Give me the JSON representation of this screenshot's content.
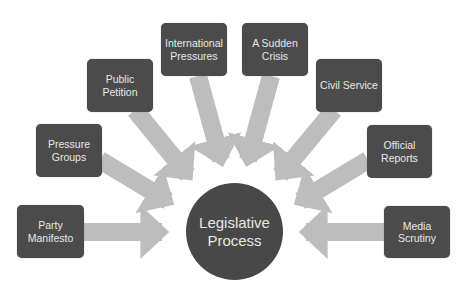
{
  "diagram": {
    "center": {
      "label_line1": "Legislative",
      "label_line2": "Process"
    },
    "sources": [
      {
        "id": "party-manifesto",
        "line1": "Party",
        "line2": "Manifesto"
      },
      {
        "id": "pressure-groups",
        "line1": "Pressure",
        "line2": "Groups"
      },
      {
        "id": "public-petition",
        "line1": "Public",
        "line2": "Petition"
      },
      {
        "id": "international-pressures",
        "line1": "International",
        "line2": "Pressures"
      },
      {
        "id": "a-sudden-crisis",
        "line1": "A Sudden",
        "line2": "Crisis"
      },
      {
        "id": "civil-service",
        "line1": "Civil Service",
        "line2": ""
      },
      {
        "id": "official-reports",
        "line1": "Official",
        "line2": "Reports"
      },
      {
        "id": "media-scrutiny",
        "line1": "Media",
        "line2": "Scrutiny"
      }
    ],
    "colors": {
      "box_fill": "#4b4b4b",
      "circle_fill": "#484848",
      "text": "#e8e8e8",
      "arrow": "#bdbdbd",
      "background": "#ffffff"
    }
  }
}
